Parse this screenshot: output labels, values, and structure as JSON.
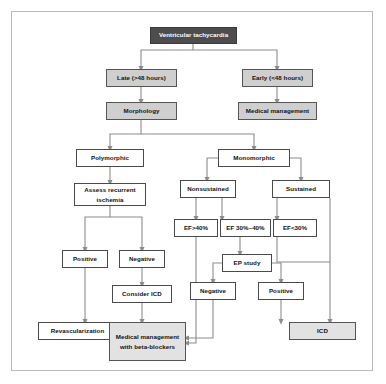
{
  "diagram": {
    "frame_border_color": "#b9b9b9",
    "connector_color": "#8c8c8c",
    "nodes": {
      "ventricular_tachycardia": "Ventricular tachycardia",
      "late": "Late (>48 hours)",
      "early": "Early (<48 hours)",
      "morphology": "Morphology",
      "medical_management": "Medical management",
      "polymorphic": "Polymorphic",
      "monomorphic": "Monomorphic",
      "assess_recurrent_ischemia": "Assess recurrent ischemia",
      "nonsustained": "Nonsustained",
      "sustained": "Sustained",
      "ef_over_40": "EF>40%",
      "ef_30_40": "EF 30%–40%",
      "ef_under_30": "EF<30%",
      "ischemia_positive": "Positive",
      "ischemia_negative": "Negative",
      "ep_study": "EP study",
      "ep_negative": "Negative",
      "ep_positive": "Positive",
      "consider_icd": "Consider ICD",
      "revascularization": "Revascularization",
      "medical_management_beta_blockers": "Medical management with beta-blockers",
      "icd": "ICD"
    },
    "node_styles": {
      "ventricular_tachycardia": "dark",
      "late": "gray",
      "early": "gray",
      "morphology": "gray",
      "medical_management": "gray",
      "polymorphic": "white",
      "monomorphic": "white",
      "assess_recurrent_ischemia": "white",
      "nonsustained": "white",
      "sustained": "white",
      "ef_over_40": "white",
      "ef_30_40": "white",
      "ef_under_30": "white",
      "ischemia_positive": "white",
      "ischemia_negative": "white",
      "ep_study": "white",
      "ep_negative": "white",
      "ep_positive": "white",
      "consider_icd": "white",
      "revascularization": "white",
      "medical_management_beta_blockers": "lightgray",
      "icd": "lightgray"
    },
    "edges": [
      {
        "from": "ventricular_tachycardia",
        "to": "late"
      },
      {
        "from": "ventricular_tachycardia",
        "to": "early"
      },
      {
        "from": "late",
        "to": "morphology"
      },
      {
        "from": "early",
        "to": "medical_management"
      },
      {
        "from": "morphology",
        "to": "polymorphic"
      },
      {
        "from": "morphology",
        "to": "monomorphic"
      },
      {
        "from": "polymorphic",
        "to": "assess_recurrent_ischemia"
      },
      {
        "from": "monomorphic",
        "to": "nonsustained"
      },
      {
        "from": "monomorphic",
        "to": "sustained"
      },
      {
        "from": "assess_recurrent_ischemia",
        "to": "ischemia_positive"
      },
      {
        "from": "assess_recurrent_ischemia",
        "to": "ischemia_negative"
      },
      {
        "from": "nonsustained",
        "to": "ef_over_40"
      },
      {
        "from": "nonsustained",
        "to": "ef_30_40"
      },
      {
        "from": "sustained",
        "to": "ef_under_30"
      },
      {
        "from": "ef_30_40",
        "to": "ep_study"
      },
      {
        "from": "ep_study",
        "to": "ep_negative"
      },
      {
        "from": "ep_study",
        "to": "ep_positive"
      },
      {
        "from": "ischemia_negative",
        "to": "consider_icd"
      },
      {
        "from": "ischemia_positive",
        "to": "revascularization"
      },
      {
        "from": "consider_icd",
        "to": "medical_management_beta_blockers"
      },
      {
        "from": "ef_over_40",
        "to": "medical_management_beta_blockers"
      },
      {
        "from": "ep_negative",
        "to": "medical_management_beta_blockers"
      },
      {
        "from": "ep_positive",
        "to": "icd"
      },
      {
        "from": "ef_under_30",
        "to": "icd"
      },
      {
        "from": "sustained",
        "to": "icd"
      }
    ]
  }
}
